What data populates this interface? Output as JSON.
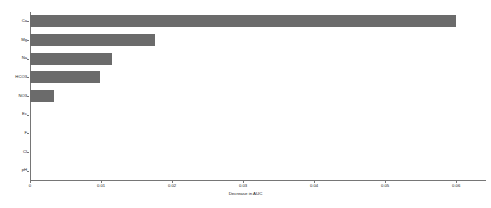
{
  "chart_data": {
    "type": "bar",
    "orientation": "horizontal",
    "title": "",
    "subtitle": "",
    "xlabel": "Decrease in AUC",
    "ylabel": "",
    "categories": [
      "Ca",
      "Mg",
      "Na",
      "HCO3",
      "NO3",
      "Ec",
      "F",
      "Cl",
      "pH"
    ],
    "values": [
      0.06,
      0.0176,
      0.0116,
      0.0099,
      0.0034,
      0.0,
      0.0,
      0.0,
      0.0
    ],
    "xlim": [
      0,
      0.0642
    ],
    "xticks": [
      0,
      0.01,
      0.02,
      0.03,
      0.04,
      0.05,
      0.06
    ],
    "xtick_labels": [
      "0",
      "0.01",
      "0.02",
      "0.03",
      "0.04",
      "0.05",
      "0.06"
    ],
    "grid": false,
    "legend": null,
    "bar_color": "#6b6b6b",
    "axis_color": "#767676",
    "text_color": "#1a1a1a",
    "background": "#ffffff"
  }
}
